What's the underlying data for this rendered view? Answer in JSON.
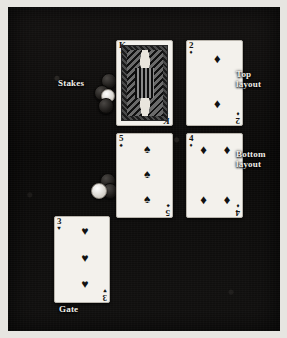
{
  "figure": {
    "background_color": "#0e0d0c",
    "mount_color": "#e7e5e1"
  },
  "labels": {
    "stakes": "Stakes",
    "top_layout_line1": "Top",
    "top_layout_line2": "layout",
    "bottom_layout_line1": "Bottom",
    "bottom_layout_line2": "layout",
    "gate": "Gate"
  },
  "cards": [
    {
      "id": "top-left",
      "rank": "K",
      "suit": "spades",
      "suit_symbol": "♠",
      "color": "black",
      "pip_count": 0,
      "is_court": true,
      "position_label": "Top layout left"
    },
    {
      "id": "top-right",
      "rank": "2",
      "suit": "diamonds",
      "suit_symbol": "♦",
      "color": "black",
      "pip_count": 2,
      "is_court": false,
      "position_label": "Top layout right"
    },
    {
      "id": "bottom-left",
      "rank": "5",
      "suit": "spades",
      "suit_symbol": "♠",
      "color": "black",
      "pip_count": 3,
      "is_court": false,
      "position_label": "Bottom layout left"
    },
    {
      "id": "bottom-right",
      "rank": "4",
      "suit": "diamonds",
      "suit_symbol": "♦",
      "color": "black",
      "pip_count": 4,
      "is_court": false,
      "position_label": "Bottom layout right"
    },
    {
      "id": "gate-card",
      "rank": "3",
      "suit": "hearts",
      "suit_symbol": "♥",
      "color": "black",
      "pip_count": 3,
      "is_court": false,
      "position_label": "Gate"
    }
  ],
  "chip_stacks": [
    {
      "id": "stakes-stack",
      "dark_chips": 3,
      "light_chips": 1
    },
    {
      "id": "gate-stack",
      "dark_chips": 2,
      "light_chips": 1
    }
  ]
}
